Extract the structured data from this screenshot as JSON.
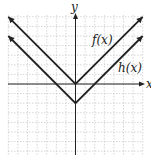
{
  "chart_data": {
    "type": "line",
    "title": "",
    "xlabel": "x",
    "ylabel": "y",
    "grid": true,
    "xlim": [
      -7,
      7
    ],
    "ylim": [
      -7,
      7.5
    ],
    "series": [
      {
        "name": "f(x)",
        "label": "f(x)",
        "formula": "|x|",
        "x": [
          -7,
          0,
          7
        ],
        "y": [
          7,
          0,
          7
        ]
      },
      {
        "name": "h(x)",
        "label": "h(x)",
        "formula": "|x| - 2",
        "x": [
          -7,
          0,
          7
        ],
        "y": [
          5,
          -2,
          5
        ]
      }
    ],
    "legend": "inline labels"
  },
  "labels": {
    "x_axis": "x",
    "y_axis": "y",
    "f": "f(x)",
    "h": "h(x)"
  }
}
